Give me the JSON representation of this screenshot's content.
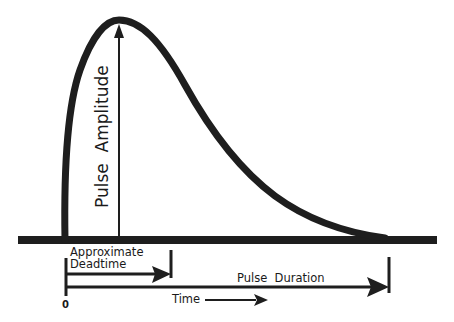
{
  "diagram": {
    "colors": {
      "ink": "#1e1e1e",
      "background": "#ffffff"
    },
    "labels": {
      "amplitude": "Pulse  Amplitude",
      "deadtime_line1": "Approximate",
      "deadtime_line2": "Deadtime",
      "duration": "Pulse  Duration",
      "time": "Time",
      "origin": "0"
    },
    "elements": [
      {
        "id": "pulse-curve",
        "type": "curve",
        "description": "Asymmetric pulse: fast rise, slow exponential-like decay to baseline"
      },
      {
        "id": "baseline",
        "type": "line",
        "description": "Thick horizontal baseline"
      },
      {
        "id": "amplitude-arrow",
        "type": "arrow",
        "description": "Vertical arrow from baseline to pulse peak"
      },
      {
        "id": "deadtime-arrow",
        "type": "arrow",
        "description": "Horizontal arrow from origin to end of deadtime"
      },
      {
        "id": "duration-arrow",
        "type": "arrow",
        "description": "Horizontal arrow from origin to end of pulse"
      },
      {
        "id": "time-arrow",
        "type": "arrow",
        "description": "Time direction indicator"
      }
    ]
  }
}
